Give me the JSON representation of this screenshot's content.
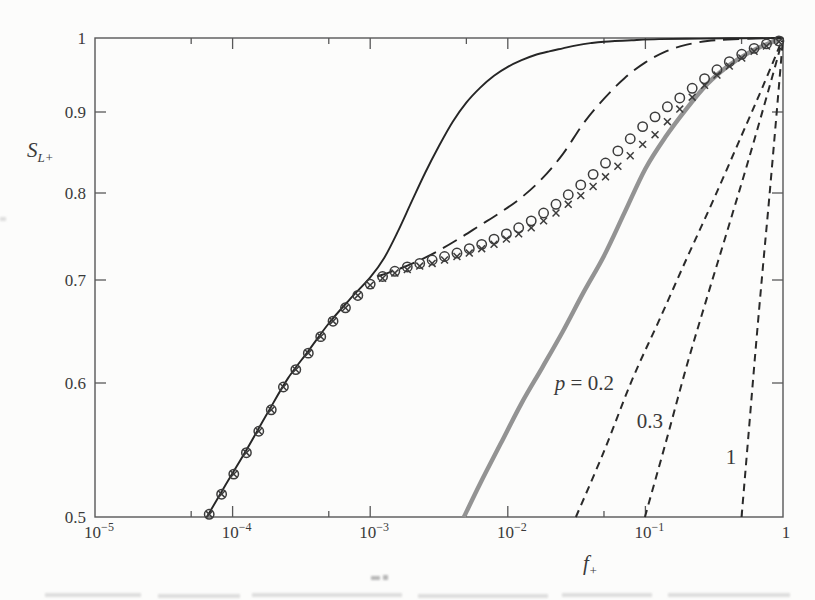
{
  "figure": {
    "background": "#fcfcfb",
    "frame_color": "#585858",
    "ink_color": "#3a3a3a",
    "ylabel": {
      "base": "S",
      "sub": "L+"
    },
    "xlabel": {
      "base": "f",
      "sub": "+"
    },
    "x_ticks": [
      {
        "base": "10",
        "exp": "−5",
        "value": 1e-05
      },
      {
        "base": "10",
        "exp": "−4",
        "value": 0.0001
      },
      {
        "base": "10",
        "exp": "−3",
        "value": 0.001
      },
      {
        "base": "10",
        "exp": "−2",
        "value": 0.01
      },
      {
        "base": "10",
        "exp": "−1",
        "value": 0.1
      },
      {
        "base": "1",
        "exp": "",
        "value": 1
      }
    ],
    "x_minor_ticks": [
      5e-05,
      0.0005,
      0.005,
      0.05,
      0.5
    ],
    "y_ticks": [
      {
        "label": "1",
        "value": 1.0
      },
      {
        "label": "0.9",
        "value": 0.9
      },
      {
        "label": "0.8",
        "value": 0.8
      },
      {
        "label": "0.7",
        "value": 0.7
      },
      {
        "label": "0.6",
        "value": 0.6
      },
      {
        "label": "0.5",
        "value": 0.5
      }
    ]
  },
  "chart_data": {
    "type": "line",
    "title": "",
    "xlabel": "f+",
    "ylabel": "SL+",
    "x_scale": "log",
    "x_range": [
      1e-05,
      1
    ],
    "y_scale": "log",
    "y_range": [
      0.5,
      1
    ],
    "grid": false,
    "legend": "none",
    "annotations": [
      {
        "parts": [
          {
            "text": "p",
            "italic": true
          },
          {
            "text": " = 0.2",
            "italic": false
          }
        ],
        "f": 0.036,
        "S": 0.6
      },
      {
        "parts": [
          {
            "text": "0.3",
            "italic": false
          }
        ],
        "f": 0.108,
        "S": 0.572
      },
      {
        "parts": [
          {
            "text": "1",
            "italic": false
          }
        ],
        "f": 0.419,
        "S": 0.545
      }
    ],
    "series": [
      {
        "name": "power-law-p-0.2",
        "style": "line",
        "color": "#2a2a2a",
        "width": 2,
        "dash": "7.5,5.5",
        "points": [
          [
            0.03125,
            0.5
          ],
          [
            0.05,
            0.549
          ],
          [
            0.08,
            0.603
          ],
          [
            0.126,
            0.661
          ],
          [
            0.2,
            0.725
          ],
          [
            0.316,
            0.794
          ],
          [
            0.5,
            0.871
          ],
          [
            0.708,
            0.933
          ],
          [
            1,
            1.0
          ]
        ]
      },
      {
        "name": "power-law-p-0.3",
        "style": "line",
        "color": "#2a2a2a",
        "width": 2,
        "dash": "7.5,5.5",
        "points": [
          [
            0.0992,
            0.5
          ],
          [
            0.141,
            0.556
          ],
          [
            0.2,
            0.617
          ],
          [
            0.282,
            0.684
          ],
          [
            0.398,
            0.759
          ],
          [
            0.562,
            0.841
          ],
          [
            0.794,
            0.933
          ],
          [
            1,
            1.0
          ]
        ]
      },
      {
        "name": "power-law-p-1",
        "style": "line",
        "color": "#2a2a2a",
        "width": 2,
        "dash": "7.5,5.5",
        "points": [
          [
            0.5,
            0.5
          ],
          [
            0.562,
            0.562
          ],
          [
            0.631,
            0.631
          ],
          [
            0.708,
            0.708
          ],
          [
            0.794,
            0.794
          ],
          [
            0.891,
            0.891
          ],
          [
            1,
            1.0
          ]
        ]
      },
      {
        "name": "thick-gray-model",
        "style": "line",
        "color": "#939393",
        "width": 4.4,
        "dash": "",
        "points": [
          [
            0.0048,
            0.5
          ],
          [
            0.0063,
            0.525
          ],
          [
            0.0089,
            0.555
          ],
          [
            0.0126,
            0.585
          ],
          [
            0.0178,
            0.615
          ],
          [
            0.0251,
            0.65
          ],
          [
            0.0355,
            0.688
          ],
          [
            0.0501,
            0.728
          ],
          [
            0.0708,
            0.778
          ],
          [
            0.1,
            0.83
          ],
          [
            0.141,
            0.87
          ],
          [
            0.2,
            0.905
          ],
          [
            0.282,
            0.938
          ],
          [
            0.398,
            0.962
          ],
          [
            0.562,
            0.98
          ],
          [
            0.794,
            0.993
          ],
          [
            1,
            1.0
          ]
        ]
      },
      {
        "name": "long-dash-model",
        "style": "line",
        "color": "#262626",
        "width": 1.9,
        "dash": "16,8",
        "points": [
          [
            0.00112,
            0.704
          ],
          [
            0.00158,
            0.712
          ],
          [
            0.00224,
            0.722
          ],
          [
            0.00316,
            0.734
          ],
          [
            0.00447,
            0.748
          ],
          [
            0.00631,
            0.763
          ],
          [
            0.00891,
            0.778
          ],
          [
            0.0126,
            0.795
          ],
          [
            0.0178,
            0.818
          ],
          [
            0.0251,
            0.848
          ],
          [
            0.0355,
            0.886
          ],
          [
            0.0501,
            0.918
          ],
          [
            0.0708,
            0.946
          ],
          [
            0.1,
            0.967
          ],
          [
            0.141,
            0.982
          ],
          [
            0.2,
            0.991
          ],
          [
            0.282,
            0.996
          ],
          [
            0.398,
            0.998
          ],
          [
            0.631,
            0.9993
          ],
          [
            1,
            1.0
          ]
        ]
      },
      {
        "name": "solid-equilibrium",
        "style": "line",
        "color": "#262626",
        "width": 1.9,
        "dash": "",
        "points": [
          [
            6.5e-05,
            0.5
          ],
          [
            8.9e-05,
            0.524
          ],
          [
            0.000126,
            0.55
          ],
          [
            0.000178,
            0.577
          ],
          [
            0.000251,
            0.604
          ],
          [
            0.000355,
            0.631
          ],
          [
            0.000501,
            0.658
          ],
          [
            0.000708,
            0.681
          ],
          [
            0.001,
            0.703
          ],
          [
            0.00126,
            0.725
          ],
          [
            0.00158,
            0.755
          ],
          [
            0.002,
            0.79
          ],
          [
            0.00251,
            0.825
          ],
          [
            0.00316,
            0.858
          ],
          [
            0.00398,
            0.888
          ],
          [
            0.00501,
            0.913
          ],
          [
            0.00631,
            0.933
          ],
          [
            0.00794,
            0.949
          ],
          [
            0.01,
            0.961
          ],
          [
            0.0126,
            0.97
          ],
          [
            0.0158,
            0.977
          ],
          [
            0.02,
            0.982
          ],
          [
            0.0251,
            0.986
          ],
          [
            0.0316,
            0.99
          ],
          [
            0.0398,
            0.993
          ],
          [
            0.0501,
            0.995
          ],
          [
            0.0794,
            0.997
          ],
          [
            0.126,
            0.9985
          ],
          [
            0.251,
            0.9992
          ],
          [
            0.501,
            0.9997
          ],
          [
            1,
            1.0
          ]
        ]
      },
      {
        "name": "cross-markers",
        "style": "marker-cross",
        "color": "#3c3c3c",
        "width": 1.5,
        "size": 4.4,
        "x": [
          6.76e-05,
          8.32e-05,
          0.000102,
          0.000126,
          0.000155,
          0.000191,
          0.000234,
          0.000288,
          0.000355,
          0.000437,
          0.000537,
          0.000661,
          0.000813,
          0.001,
          0.00123,
          0.00151,
          0.00186,
          0.00229,
          0.00282,
          0.00347,
          0.00427,
          0.00525,
          0.00646,
          0.00794,
          0.00977,
          0.012,
          0.0148,
          0.0182,
          0.0224,
          0.0275,
          0.0339,
          0.0417,
          0.0513,
          0.0631,
          0.0776,
          0.0955,
          0.1175,
          0.1445,
          0.1778,
          0.2188,
          0.2692,
          0.3311,
          0.4074,
          0.5012,
          0.6166,
          0.7586,
          0.9333
        ],
        "y": [
          0.502,
          0.517,
          0.532,
          0.548,
          0.564,
          0.58,
          0.597,
          0.613,
          0.629,
          0.645,
          0.66,
          0.673,
          0.685,
          0.695,
          0.702,
          0.708,
          0.712,
          0.716,
          0.719,
          0.723,
          0.727,
          0.731,
          0.736,
          0.741,
          0.747,
          0.753,
          0.76,
          0.768,
          0.777,
          0.787,
          0.797,
          0.808,
          0.82,
          0.833,
          0.846,
          0.86,
          0.872,
          0.888,
          0.904,
          0.92,
          0.936,
          0.95,
          0.962,
          0.973,
          0.982,
          0.989,
          0.995
        ]
      },
      {
        "name": "circle-markers",
        "style": "marker-circle",
        "color": "#3c3c3c",
        "width": 1.5,
        "size": 4.7,
        "x": [
          6.76e-05,
          8.32e-05,
          0.000102,
          0.000126,
          0.000155,
          0.000191,
          0.000234,
          0.000288,
          0.000355,
          0.000437,
          0.000537,
          0.000661,
          0.000813,
          0.001,
          0.00123,
          0.00151,
          0.00186,
          0.00229,
          0.00282,
          0.00347,
          0.00427,
          0.00525,
          0.00646,
          0.00794,
          0.00977,
          0.012,
          0.0148,
          0.0182,
          0.0224,
          0.0275,
          0.0339,
          0.0417,
          0.0513,
          0.0631,
          0.0776,
          0.0955,
          0.1175,
          0.1445,
          0.1778,
          0.2188,
          0.2692,
          0.3311,
          0.4074,
          0.5012,
          0.6166,
          0.7586,
          0.9333
        ],
        "y": [
          0.502,
          0.517,
          0.532,
          0.548,
          0.564,
          0.58,
          0.597,
          0.613,
          0.629,
          0.645,
          0.66,
          0.673,
          0.685,
          0.696,
          0.704,
          0.71,
          0.715,
          0.719,
          0.723,
          0.727,
          0.731,
          0.736,
          0.741,
          0.747,
          0.753,
          0.76,
          0.768,
          0.777,
          0.787,
          0.798,
          0.81,
          0.823,
          0.837,
          0.852,
          0.867,
          0.882,
          0.894,
          0.907,
          0.919,
          0.932,
          0.945,
          0.957,
          0.968,
          0.978,
          0.986,
          0.992,
          0.996
        ]
      }
    ]
  }
}
